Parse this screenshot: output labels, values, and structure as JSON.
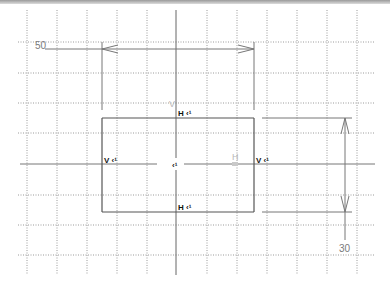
{
  "app": {
    "view": "sketch-canvas"
  },
  "colors": {
    "background": "#ffffff",
    "grid": "#9a9a9a",
    "geometry": "#555555",
    "axis": "#666666",
    "dimension": "#777777",
    "constraint_text": "#111111"
  },
  "grid": {
    "spacing_px": 30,
    "vertical_x": [
      27,
      57,
      87,
      117,
      147,
      207,
      237,
      267,
      297,
      327,
      357
    ],
    "horizontal_y": [
      42,
      73,
      103,
      133,
      195,
      225,
      255
    ]
  },
  "axes": {
    "h_axis_label": "H",
    "origin_symbol": "V"
  },
  "sketch": {
    "rectangle": {
      "x1": 102,
      "y1": 118,
      "x2": 254,
      "y2": 212
    },
    "constraints": {
      "top": "H ‹¹",
      "bottom": "H ‹¹",
      "left": "V ‹¹",
      "right": "V ‹¹",
      "origin": "‹¹"
    }
  },
  "dimensions": {
    "width": {
      "value": "50"
    },
    "height": {
      "value": "30"
    }
  }
}
